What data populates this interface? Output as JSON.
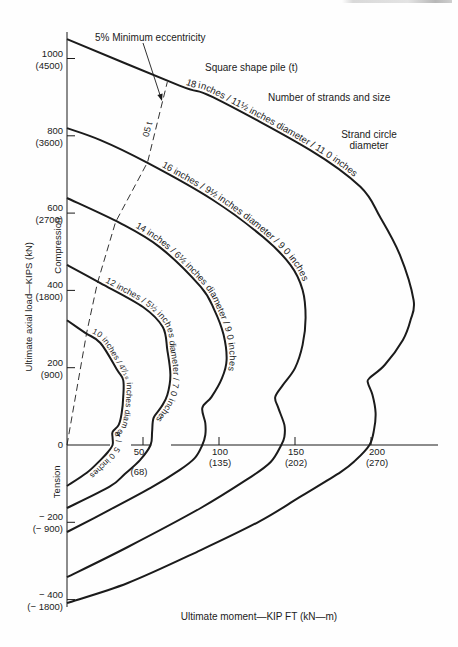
{
  "chart_data": {
    "type": "line",
    "title": "",
    "xlabel": "Ultimate moment—KIP FT (kN—m)",
    "ylabel": "Ultimate axial load—KIPS (kN)",
    "xlim": [
      0,
      245
    ],
    "ylim": [
      -420,
      1080
    ],
    "grid": false,
    "legend": null,
    "x_ticks": [
      {
        "value": 50,
        "label": "50",
        "sub": "(68)"
      },
      {
        "value": 100,
        "label": "100",
        "sub": "(135)"
      },
      {
        "value": 150,
        "label": "150",
        "sub": "(202)"
      },
      {
        "value": 200,
        "label": "200",
        "sub": "(270)"
      }
    ],
    "y_ticks": [
      {
        "value": 1000,
        "label": "1000",
        "sub": "(4500)"
      },
      {
        "value": 800,
        "label": "800",
        "sub": "(3600)"
      },
      {
        "value": 600,
        "label": "600",
        "sub": "(2700)"
      },
      {
        "value": 400,
        "label": "400",
        "sub": "(1800)"
      },
      {
        "value": 200,
        "label": "200",
        "sub": "(900)"
      },
      {
        "value": 0,
        "label": "0",
        "sub": ""
      },
      {
        "value": -200,
        "label": "− 200",
        "sub": "(− 900)"
      },
      {
        "value": -400,
        "label": "− 400",
        "sub": "(− 1800)"
      }
    ],
    "series": [
      {
        "name": "18 inches",
        "label": "18 inches / 11½ inches diameter / 11 0 inches",
        "points": [
          [
            0,
            1050
          ],
          [
            74,
            930
          ],
          [
            96,
            900
          ],
          [
            160,
            763
          ],
          [
            193,
            668
          ],
          [
            206,
            590
          ],
          [
            219,
            492
          ],
          [
            228,
            375
          ],
          [
            226,
            323
          ],
          [
            221,
            272
          ],
          [
            209,
            207
          ],
          [
            199,
            173
          ],
          [
            198,
            160
          ],
          [
            201,
            129
          ],
          [
            203,
            83
          ],
          [
            202,
            39
          ],
          [
            199,
            0
          ],
          [
            190,
            -39
          ],
          [
            180,
            -70
          ],
          [
            153,
            -135
          ],
          [
            127,
            -197
          ],
          [
            88,
            -272
          ],
          [
            40,
            -357
          ],
          [
            0,
            -409
          ]
        ]
      },
      {
        "name": "16 inches",
        "label": "16 inches / 9½ inches diameter / 9 0 inches",
        "points": [
          [
            0,
            820
          ],
          [
            22,
            789
          ],
          [
            53,
            730
          ],
          [
            96,
            634
          ],
          [
            129,
            538
          ],
          [
            147,
            466
          ],
          [
            155,
            401
          ],
          [
            157,
            329
          ],
          [
            155,
            259
          ],
          [
            150,
            199
          ],
          [
            142,
            155
          ],
          [
            137,
            124
          ],
          [
            139,
            96
          ],
          [
            143,
            52
          ],
          [
            143,
            21
          ],
          [
            141,
            0
          ],
          [
            134,
            -44
          ],
          [
            120,
            -85
          ],
          [
            88,
            -163
          ],
          [
            40,
            -264
          ],
          [
            0,
            -342
          ]
        ]
      },
      {
        "name": "14 inches",
        "label": "14 inches / 6½ inches diameter / 9 0 inches",
        "points": [
          [
            0,
            639
          ],
          [
            35,
            574
          ],
          [
            61,
            512
          ],
          [
            88,
            409
          ],
          [
            97,
            349
          ],
          [
            103,
            285
          ],
          [
            105,
            220
          ],
          [
            102,
            173
          ],
          [
            95,
            124
          ],
          [
            89,
            96
          ],
          [
            91,
            57
          ],
          [
            91,
            26
          ],
          [
            89,
            0
          ],
          [
            84,
            -34
          ],
          [
            74,
            -65
          ],
          [
            55,
            -111
          ],
          [
            28,
            -168
          ],
          [
            0,
            -225
          ]
        ]
      },
      {
        "name": "12 inches",
        "label": "12 inches / 5½ inches diameter / 7 0 inches",
        "points": [
          [
            0,
            466
          ],
          [
            22,
            419
          ],
          [
            50,
            357
          ],
          [
            63,
            305
          ],
          [
            66,
            246
          ],
          [
            68,
            181
          ],
          [
            66,
            129
          ],
          [
            62,
            98
          ],
          [
            57,
            70
          ],
          [
            56,
            34
          ],
          [
            55,
            0
          ],
          [
            48,
            -39
          ],
          [
            38,
            -75
          ],
          [
            28,
            -108
          ],
          [
            0,
            -163
          ]
        ]
      },
      {
        "name": "10 inches",
        "label": "10 inches / 4⁷⁄₁₆ inches diameter / 5 0 inches",
        "points": [
          [
            0,
            323
          ],
          [
            12,
            290
          ],
          [
            22,
            264
          ],
          [
            33,
            194
          ],
          [
            37,
            168
          ],
          [
            37,
            124
          ],
          [
            36,
            83
          ],
          [
            34,
            52
          ],
          [
            30,
            34
          ],
          [
            30,
            18
          ],
          [
            30,
            0
          ],
          [
            27,
            -18
          ],
          [
            22,
            -39
          ],
          [
            13,
            -72
          ],
          [
            0,
            -106
          ]
        ]
      }
    ],
    "reference_line": {
      "name": "5% Minimum eccentricity",
      "label": "05 t",
      "style": "dashed",
      "points": [
        [
          0,
          0
        ],
        [
          13,
          292
        ],
        [
          20,
          419
        ],
        [
          32,
          577
        ],
        [
          53,
          732
        ],
        [
          66,
          939
        ]
      ]
    },
    "annotations": {
      "min_eccentricity": "5% Minimum eccentricity",
      "pile_shape": "Square shape pile (t)",
      "strands": "Number of strands and size",
      "strand_circle_1": "Strand circle",
      "strand_circle_2": "diameter",
      "compression": "Compression",
      "tension": "Tension"
    }
  }
}
